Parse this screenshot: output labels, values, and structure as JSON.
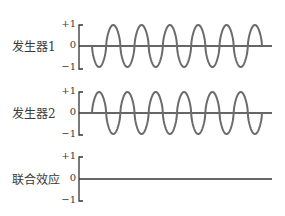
{
  "title": "",
  "panels": [
    {
      "label": "发生器1",
      "ticks": {
        "top": "+1",
        "mid": "0",
        "bottom": "−1"
      },
      "phase": "inverted"
    },
    {
      "label": "发生器2",
      "ticks": {
        "top": "+1",
        "mid": "0",
        "bottom": "−1"
      },
      "phase": "normal"
    },
    {
      "label": "联合效应",
      "ticks": {
        "top": "+1",
        "mid": "0",
        "bottom": "−1"
      },
      "phase": "flat"
    }
  ],
  "style": {
    "wave_color": "#6b6b6b",
    "axis_color": "#333333"
  },
  "wave": {
    "cycles": 6,
    "x_start": 92,
    "x_end": 262,
    "amplitude": 1
  }
}
